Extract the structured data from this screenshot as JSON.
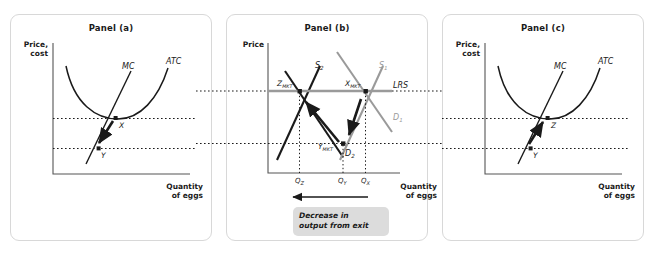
{
  "figure": {
    "background": "#ffffff",
    "panel_border_color": "#d8d8d8"
  },
  "colors": {
    "curve_dark": "#1a1a1a",
    "curve_gray": "#9a9a9a",
    "axis": "#555555",
    "dotted": "#1a1a1a",
    "callout_bg": "#dcdcdc"
  },
  "panels": [
    {
      "id": "a",
      "title": "Panel (a)",
      "y_axis_label": "Price,\ncost",
      "x_axis_label": "Quantity\nof eggs",
      "curves": [
        {
          "name": "MC",
          "label": "MC",
          "color": "#1a1a1a"
        },
        {
          "name": "ATC",
          "label": "ATC",
          "color": "#1a1a1a"
        }
      ],
      "points": [
        {
          "name": "X",
          "label": "X"
        },
        {
          "name": "Y",
          "label": "Y"
        }
      ],
      "arrow_direction": "down"
    },
    {
      "id": "b",
      "title": "Panel (b)",
      "y_axis_label": "Price",
      "x_axis_label": "Quantity\nof eggs",
      "curves": [
        {
          "name": "S2",
          "label": "S",
          "sub": "2",
          "color": "#1a1a1a"
        },
        {
          "name": "S1",
          "label": "S",
          "sub": "1",
          "color": "#9a9a9a"
        },
        {
          "name": "D1",
          "label": "D",
          "sub": "1",
          "color": "#9a9a9a"
        },
        {
          "name": "D2",
          "label": "D",
          "sub": "2",
          "color": "#1a1a1a"
        },
        {
          "name": "LRS",
          "label": "LRS",
          "sub": "",
          "color": "#9a9a9a"
        }
      ],
      "points": [
        {
          "name": "Z_MKT",
          "label": "Z",
          "sub": "MKT"
        },
        {
          "name": "X_MKT",
          "label": "X",
          "sub": "MKT"
        },
        {
          "name": "Y_MKT",
          "label": "Y",
          "sub": "MKT"
        }
      ],
      "x_ticks": [
        {
          "label": "Q",
          "sub": "Z"
        },
        {
          "label": "Q",
          "sub": "Y"
        },
        {
          "label": "Q",
          "sub": "X"
        }
      ],
      "callout": "Decrease in\noutput from exit",
      "arrow_direction": "left"
    },
    {
      "id": "c",
      "title": "Panel (c)",
      "y_axis_label": "Price,\ncost",
      "x_axis_label": "Quantity\nof eggs",
      "curves": [
        {
          "name": "MC",
          "label": "MC",
          "color": "#1a1a1a"
        },
        {
          "name": "ATC",
          "label": "ATC",
          "color": "#1a1a1a"
        }
      ],
      "points": [
        {
          "name": "Z",
          "label": "Z"
        },
        {
          "name": "Y",
          "label": "Y"
        }
      ],
      "arrow_direction": "up"
    }
  ]
}
